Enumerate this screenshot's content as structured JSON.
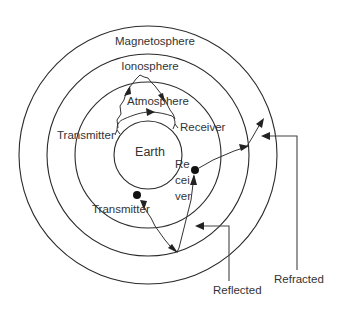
{
  "diagram": {
    "layers": [
      {
        "name": "Earth",
        "label": "Earth"
      },
      {
        "name": "Atmosphere",
        "label": "Atmosphere"
      },
      {
        "name": "Ionosphere",
        "label": "Ionosphere"
      },
      {
        "name": "Magnetosphere",
        "label": "Magnetosphere"
      }
    ],
    "stations": {
      "upper_transmitter": "Transmitter",
      "upper_receiver": "Receiver",
      "lower_transmitter": "Transmitter",
      "lower_receiver_line1": "Re",
      "lower_receiver_line2": "cei",
      "lower_receiver_line3": "ver"
    },
    "callouts": {
      "reflected": "Reflected",
      "refracted": "Refracted"
    },
    "paths": [
      {
        "name": "ground-wave",
        "from": "upper_transmitter",
        "to": "upper_receiver",
        "via": "Atmosphere"
      },
      {
        "name": "sky-wave",
        "from": "upper_transmitter",
        "to": "upper_receiver",
        "via": "Ionosphere"
      },
      {
        "name": "reflected-wave",
        "from": "lower_transmitter",
        "to": "lower_receiver",
        "via": "Ionosphere",
        "type": "Reflected"
      },
      {
        "name": "refracted-wave",
        "from": "lower_receiver",
        "to": "Magnetosphere",
        "type": "Refracted"
      }
    ],
    "colors": {
      "stroke": "#2b2b2b",
      "text": "#333333",
      "background": "#ffffff"
    }
  }
}
